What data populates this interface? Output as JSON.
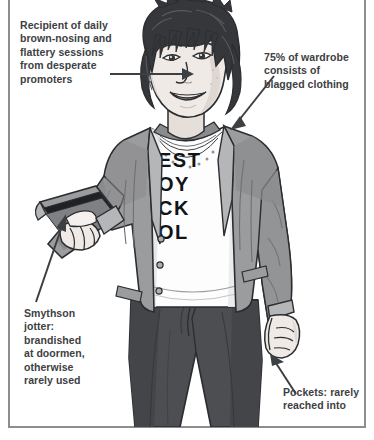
{
  "page": {
    "width": 374,
    "height": 440,
    "background": "#ffffff",
    "rule_color": "#8b8d8f"
  },
  "figure": {
    "tshirt_text": "DESTROY ROCK N ROLL",
    "tshirt_visible_letters": [
      "E",
      "S",
      "T",
      "O",
      "Y",
      "C",
      "K",
      "O",
      "L"
    ],
    "colors": {
      "jacket": "#9b9c9e",
      "jacket_shadow": "#7d7e80",
      "jacket_light": "#b5b6b8",
      "trousers": "#4c4e51",
      "trousers_shadow": "#3a3c3f",
      "shirt": "#fdfdfd",
      "shirt_shade": "#e3e4e5",
      "hair": "#35373a",
      "hair_highlight": "#55585c",
      "skin": "#f0eae6",
      "skin_shade": "#d6cfca",
      "outline": "#2b2d30",
      "notebook": "#9b9c9e",
      "notebook_edge": "#1f2124"
    }
  },
  "annotations": [
    {
      "id": "top-left",
      "text": "Recipient of daily\nbrown-nosing and\nflattery sessions\nfrom desperate\npromoters",
      "points_to": "face"
    },
    {
      "id": "top-right",
      "text": "75% of wardrobe\nconsists of\nblagged clothing",
      "points_to": "jacket-shoulder"
    },
    {
      "id": "bottom-left",
      "text": "Smythson\njotter:\nbrandished\nat doormen,\notherwise\nrarely used",
      "points_to": "notebook"
    },
    {
      "id": "bottom-right",
      "text": "Pockets: rarely\nreached into",
      "points_to": "hand-pocket"
    }
  ],
  "style": {
    "caption_color": "#3d4043",
    "leader_color": "#3d4043"
  }
}
